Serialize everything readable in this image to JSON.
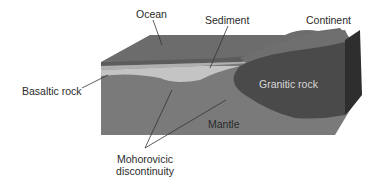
{
  "diagram": {
    "type": "cross-section block diagram",
    "labels": {
      "ocean": "Ocean",
      "sediment": "Sediment",
      "continent": "Continent",
      "basaltic_rock": "Basaltic rock",
      "granitic_rock": "Granitic rock",
      "mantle": "Mantle",
      "moho_line1": "Mohorovicic",
      "moho_line2": "discontinuity"
    },
    "colors": {
      "ocean_top": "#6a6a6a",
      "ocean_front": "#5e5e5e",
      "sediment": "#b4b4b4",
      "basalt": "#c2c2c2",
      "granite": "#4a4a4a",
      "mantle": "#7c7c7c",
      "continent_side": "#2e2e2e",
      "leader": "#333333"
    }
  }
}
